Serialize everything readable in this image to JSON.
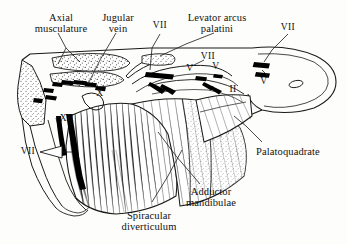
{
  "figure": {
    "panel_label": "(b)",
    "background_color": "#fdfdfb",
    "ink_color": "#1a1a18"
  },
  "labels": {
    "axial_musculature": "Axial\nmusculature",
    "jugular_vein": "Jugular\nvein",
    "vii_top_left": "VII",
    "levator_arcus_palatini": "Levator arcus\npalatini",
    "vii_mid": "VII",
    "vii_top_right": "VII",
    "v_left": "V",
    "v_mid": "V",
    "v_right": "V",
    "ii": "II",
    "x": "X",
    "xii": "XII",
    "vii_lower_left": "VII",
    "palatoquadrate": "Palatoquadrate",
    "adductor_mandibulae": "Adductor\nmandibulae",
    "spiracular_diverticulum": "Spiracular\ndiverticulum"
  }
}
